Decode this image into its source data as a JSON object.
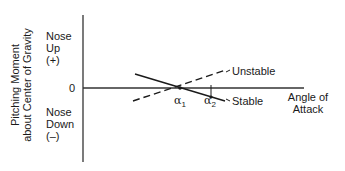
{
  "diagram": {
    "y_axis_title_line1": "Pitching Moment",
    "y_axis_title_line2": "about Center of Gravity",
    "nose_up": {
      "line1": "Nose",
      "line2": "Up",
      "line3": "(+)"
    },
    "zero_label": "0",
    "nose_down": {
      "line1": "Nose",
      "line2": "Down",
      "line3": "(–)"
    },
    "x_axis_title_line1": "Angle of",
    "x_axis_title_line2": "Attack",
    "unstable_label": "Unstable",
    "stable_label": "Stable",
    "alpha1": {
      "symbol": "α",
      "sub": "1"
    },
    "alpha2": {
      "symbol": "α",
      "sub": "2"
    },
    "colors": {
      "ink": "#1a1a1a",
      "axis": "#333333",
      "background": "#ffffff"
    }
  }
}
